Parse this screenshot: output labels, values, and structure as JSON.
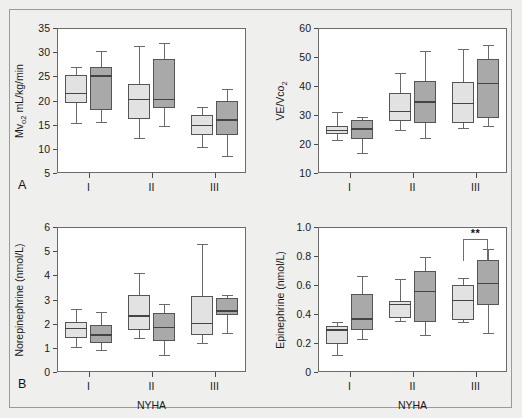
{
  "figure": {
    "background_color": "#efefed",
    "plot_background": "#ffffff",
    "light_box_color": "#e2e2e2",
    "dark_box_color": "#a9a9a9",
    "border_color": "#6b6b6b",
    "panel_a_letter": "A",
    "panel_b_letter": "B"
  },
  "chart_data": [
    {
      "type": "box",
      "panel": "A",
      "position": "top-left",
      "title": "",
      "ylabel": "Mvo2 mL/kg/min",
      "ylabel_parts": {
        "pre": "Mv",
        "sub": "o2",
        "post": " mL/kg/min"
      },
      "xlabel": "",
      "ylim": [
        5,
        35
      ],
      "yticks": [
        5,
        10,
        15,
        20,
        25,
        30,
        35
      ],
      "ytick_labels": [
        "5",
        "10",
        "15",
        "20",
        "25",
        "30",
        "35"
      ],
      "categories": [
        "I",
        "II",
        "III"
      ],
      "grid": false,
      "legend": "none",
      "series": [
        {
          "name": "light",
          "color": "#e2e2e2",
          "boxes": [
            {
              "category": "I",
              "whisker_low": 15.4,
              "q1": 19.5,
              "median": 21.6,
              "q3": 25.3,
              "whisker_high": 27.0
            },
            {
              "category": "II",
              "whisker_low": 12.2,
              "q1": 16.2,
              "median": 20.4,
              "q3": 23.4,
              "whisker_high": 31.2
            },
            {
              "category": "III",
              "whisker_low": 10.3,
              "q1": 12.8,
              "median": 15.0,
              "q3": 17.1,
              "whisker_high": 18.7
            }
          ]
        },
        {
          "name": "dark",
          "color": "#a9a9a9",
          "boxes": [
            {
              "category": "I",
              "whisker_low": 15.6,
              "q1": 18.1,
              "median": 25.2,
              "q3": 27.0,
              "whisker_high": 30.2
            },
            {
              "category": "II",
              "whisker_low": 14.8,
              "q1": 18.4,
              "median": 20.3,
              "q3": 28.5,
              "whisker_high": 31.8
            },
            {
              "category": "III",
              "whisker_low": 8.5,
              "q1": 12.9,
              "median": 16.1,
              "q3": 19.8,
              "whisker_high": 22.4
            }
          ]
        }
      ]
    },
    {
      "type": "box",
      "panel": "A",
      "position": "top-right",
      "title": "",
      "ylabel": "VE/Vco2",
      "ylabel_parts": {
        "pre": "VE/Vco",
        "sub": "2",
        "post": ""
      },
      "xlabel": "",
      "ylim": [
        10,
        60
      ],
      "yticks": [
        10,
        20,
        30,
        40,
        50,
        60
      ],
      "ytick_labels": [
        "10",
        "20",
        "30",
        "40",
        "50",
        "60"
      ],
      "categories": [
        "I",
        "II",
        "III"
      ],
      "grid": false,
      "legend": "none",
      "series": [
        {
          "name": "light",
          "color": "#e2e2e2",
          "boxes": [
            {
              "category": "I",
              "whisker_low": 21.4,
              "q1": 23.6,
              "median": 24.8,
              "q3": 26.1,
              "whisker_high": 31.2
            },
            {
              "category": "II",
              "whisker_low": 24.8,
              "q1": 28.0,
              "median": 31.4,
              "q3": 37.6,
              "whisker_high": 44.6
            },
            {
              "category": "III",
              "whisker_low": 25.6,
              "q1": 27.2,
              "median": 34.3,
              "q3": 41.4,
              "whisker_high": 52.7
            }
          ]
        },
        {
          "name": "dark",
          "color": "#a9a9a9",
          "boxes": [
            {
              "category": "I",
              "whisker_low": 17.0,
              "q1": 21.8,
              "median": 25.4,
              "q3": 28.4,
              "whisker_high": 29.2
            },
            {
              "category": "II",
              "whisker_low": 22.0,
              "q1": 27.1,
              "median": 34.7,
              "q3": 41.6,
              "whisker_high": 52.0
            },
            {
              "category": "III",
              "whisker_low": 26.2,
              "q1": 28.8,
              "median": 41.0,
              "q3": 49.4,
              "whisker_high": 54.1
            }
          ]
        }
      ]
    },
    {
      "type": "box",
      "panel": "B",
      "position": "bottom-left",
      "title": "",
      "ylabel": "Norepinephrine (nmol/L)",
      "xlabel": "NYHA",
      "ylim": [
        0,
        6
      ],
      "yticks": [
        0,
        1,
        2,
        3,
        4,
        5,
        6
      ],
      "ytick_labels": [
        "0",
        "1",
        "2",
        "3",
        "4",
        "5",
        "6"
      ],
      "categories": [
        "I",
        "II",
        "III"
      ],
      "grid": false,
      "legend": "none",
      "series": [
        {
          "name": "light",
          "color": "#e2e2e2",
          "boxes": [
            {
              "category": "I",
              "whisker_low": 1.02,
              "q1": 1.4,
              "median": 1.82,
              "q3": 2.08,
              "whisker_high": 2.62
            },
            {
              "category": "II",
              "whisker_low": 1.4,
              "q1": 1.72,
              "median": 2.35,
              "q3": 3.18,
              "whisker_high": 4.1
            },
            {
              "category": "III",
              "whisker_low": 1.2,
              "q1": 1.52,
              "median": 2.04,
              "q3": 3.15,
              "whisker_high": 5.3
            }
          ]
        },
        {
          "name": "dark",
          "color": "#a9a9a9",
          "boxes": [
            {
              "category": "I",
              "whisker_low": 0.92,
              "q1": 1.18,
              "median": 1.56,
              "q3": 1.96,
              "whisker_high": 2.5
            },
            {
              "category": "II",
              "whisker_low": 0.72,
              "q1": 1.28,
              "median": 1.86,
              "q3": 2.46,
              "whisker_high": 2.82
            },
            {
              "category": "III",
              "whisker_low": 1.62,
              "q1": 2.36,
              "median": 2.55,
              "q3": 3.08,
              "whisker_high": 3.18
            }
          ]
        }
      ]
    },
    {
      "type": "box",
      "panel": "B",
      "position": "bottom-right",
      "title": "",
      "ylabel": "Epinephrine (nmol/L)",
      "xlabel": "NYHA",
      "ylim": [
        0,
        1.0
      ],
      "yticks": [
        0,
        0.2,
        0.4,
        0.6,
        0.8,
        1.0
      ],
      "ytick_labels": [
        "0",
        "0.2",
        "0.4",
        "0.6",
        "0.8",
        "1.0"
      ],
      "categories": [
        "I",
        "II",
        "III"
      ],
      "grid": false,
      "legend": "none",
      "annotations": [
        {
          "label": "**",
          "category": "III",
          "between": [
            "light",
            "dark"
          ],
          "y": 0.92
        }
      ],
      "series": [
        {
          "name": "light",
          "color": "#e2e2e2",
          "boxes": [
            {
              "category": "I",
              "whisker_low": 0.115,
              "q1": 0.19,
              "median": 0.295,
              "q3": 0.315,
              "whisker_high": 0.345
            },
            {
              "category": "II",
              "whisker_low": 0.35,
              "q1": 0.375,
              "median": 0.47,
              "q3": 0.492,
              "whisker_high": 0.64
            },
            {
              "category": "III",
              "whisker_low": 0.345,
              "q1": 0.36,
              "median": 0.5,
              "q3": 0.6,
              "whisker_high": 0.645
            }
          ]
        },
        {
          "name": "dark",
          "color": "#a9a9a9",
          "boxes": [
            {
              "category": "I",
              "whisker_low": 0.23,
              "q1": 0.288,
              "median": 0.37,
              "q3": 0.535,
              "whisker_high": 0.665
            },
            {
              "category": "II",
              "whisker_low": 0.258,
              "q1": 0.345,
              "median": 0.56,
              "q3": 0.698,
              "whisker_high": 0.79
            },
            {
              "category": "III",
              "whisker_low": 0.268,
              "q1": 0.462,
              "median": 0.615,
              "q3": 0.772,
              "whisker_high": 0.845
            }
          ]
        }
      ]
    }
  ]
}
